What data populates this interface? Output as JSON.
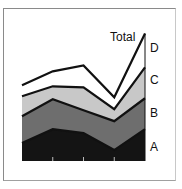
{
  "chart_data": {
    "type": "area",
    "stacked": true,
    "title": "",
    "xlabel": "",
    "ylabel": "",
    "x": [
      1,
      2,
      3,
      4,
      5
    ],
    "series": [
      {
        "name": "A",
        "values": [
          18,
          32,
          28,
          11,
          32
        ],
        "color": "#141414"
      },
      {
        "name": "B",
        "values": [
          27,
          30,
          23,
          29,
          31
        ],
        "color": "#6e6e6e"
      },
      {
        "name": "C",
        "values": [
          20,
          13,
          23,
          12,
          31
        ],
        "color": "#c8c8c8"
      },
      {
        "name": "D",
        "values": [
          11,
          15,
          22,
          12,
          34
        ],
        "color": "#ffffff"
      }
    ],
    "total_label": "Total",
    "totals": [
      76,
      90,
      96,
      64,
      128
    ],
    "legend_position": "right-inline",
    "grid": false
  },
  "labels": {
    "total": "Total",
    "d": "D",
    "c": "C",
    "b": "B",
    "a": "A"
  }
}
